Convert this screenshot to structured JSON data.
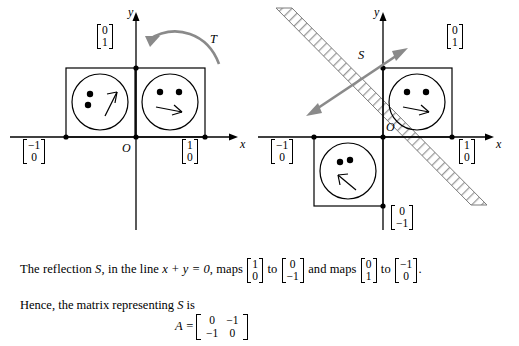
{
  "figure": {
    "left_diagram": {
      "axis_x_label": "x",
      "axis_y_label": "y",
      "origin_label": "O",
      "vector_top": [
        "0",
        "1"
      ],
      "vector_left": [
        "−1",
        "0"
      ],
      "vector_right": [
        "1",
        "0"
      ],
      "map_label": "T"
    },
    "right_diagram": {
      "axis_x_label": "x",
      "axis_y_label": "y",
      "origin_label": "O",
      "vector_top": [
        "0",
        "1"
      ],
      "vector_left": [
        "−1",
        "0"
      ],
      "vector_right": [
        "1",
        "0"
      ],
      "vector_bottom": [
        "0",
        "−1"
      ],
      "map_label": "S"
    }
  },
  "text": {
    "sentence1_part1": "The reflection ",
    "sentence1_S": "S",
    "sentence1_part2": ", in the line ",
    "sentence1_line": "x + y = 0",
    "sentence1_part3": ", maps ",
    "v1": [
      "1",
      "0"
    ],
    "sentence1_to": " to ",
    "v2": [
      "0",
      "−1"
    ],
    "sentence1_and": " and maps ",
    "v3": [
      "0",
      "1"
    ],
    "sentence1_to2": " to ",
    "v4": [
      "−1",
      "0"
    ],
    "sentence1_end": ".",
    "sentence2_part1": "Hence, the matrix representing ",
    "sentence2_S": "S",
    "sentence2_part2": " is",
    "matrix_label": "A =",
    "matrix": [
      [
        "0",
        "−1"
      ],
      [
        "−1",
        "0"
      ]
    ]
  },
  "colors": {
    "ink": "#000000",
    "arrow": "#8a8a8a",
    "hatch": "#9a9a9a"
  }
}
